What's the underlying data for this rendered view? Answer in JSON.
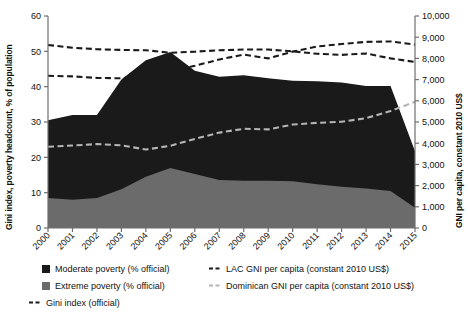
{
  "chart_data": {
    "type": "area",
    "title": "",
    "x": [
      "2000",
      "2001",
      "2002",
      "2003",
      "2004",
      "2005",
      "2006",
      "2007",
      "2008",
      "2009",
      "2010",
      "2011",
      "2012",
      "2013",
      "2014",
      "2015"
    ],
    "xlabel": "",
    "left_axis": {
      "label": "Gini index, poverty headcount, % of population",
      "ylim": [
        0,
        60
      ],
      "ticks": [
        0,
        10,
        20,
        30,
        40,
        50,
        60
      ],
      "tick_labels": [
        "0",
        "10",
        "20",
        "30",
        "40",
        "50",
        "60"
      ]
    },
    "right_axis": {
      "label": "GNI per capita, constant 2010 US$",
      "ylim": [
        0,
        10000
      ],
      "ticks": [
        0,
        1000,
        2000,
        3000,
        4000,
        5000,
        6000,
        7000,
        8000,
        9000,
        10000
      ],
      "tick_labels": [
        "0",
        "1,000",
        "2,000",
        "3,000",
        "4,000",
        "5,000",
        "6,000",
        "7,000",
        "8,000",
        "9,000",
        "10,000"
      ]
    },
    "grid": false,
    "legend_position": "below",
    "series": [
      {
        "name": "Extreme poverty (% official)",
        "type": "area",
        "axis": "left",
        "color": "#6b6b6b",
        "stack_order": 1,
        "values": [
          8.5,
          8.0,
          8.5,
          11.0,
          14.5,
          17.0,
          15.3,
          13.6,
          13.4,
          13.4,
          13.2,
          12.4,
          11.7,
          11.2,
          10.5,
          5.7
        ]
      },
      {
        "name": "Moderate poverty (% official)",
        "type": "area",
        "axis": "left",
        "color": "#1a1a1a",
        "stack_order": 2,
        "values": [
          22.0,
          24.0,
          23.5,
          31.0,
          33.0,
          32.8,
          29.2,
          29.2,
          29.8,
          29.0,
          28.5,
          29.1,
          29.5,
          29.0,
          29.7,
          16.0
        ]
      },
      {
        "name": "Gini index (official)",
        "type": "line",
        "axis": "left",
        "color": "#1a1a1a",
        "dash": "dashed",
        "values": [
          51.8,
          51.0,
          50.6,
          50.4,
          50.3,
          49.6,
          49.9,
          50.3,
          50.5,
          50.5,
          50.0,
          49.3,
          49.0,
          49.4,
          48.0,
          47.0
        ]
      },
      {
        "name": "LAC GNI per capita (constant 2010 US$)",
        "type": "line",
        "axis": "right",
        "color": "#1a1a1a",
        "dash": "dashed",
        "values": [
          7180,
          7150,
          7080,
          7060,
          7220,
          7400,
          7650,
          7950,
          8180,
          8000,
          8320,
          8560,
          8680,
          8780,
          8800,
          8650
        ]
      },
      {
        "name": "Dominican GNI per capita (constant 2010 US$)",
        "type": "line",
        "axis": "right",
        "color": "#b5b5b5",
        "dash": "dashed",
        "values": [
          3830,
          3890,
          3960,
          3900,
          3700,
          3880,
          4200,
          4500,
          4680,
          4650,
          4880,
          4960,
          5010,
          5180,
          5520,
          5950
        ]
      }
    ]
  },
  "legend": {
    "items": [
      {
        "label": "Moderate poverty (% official)",
        "marker": "swatch",
        "color": "#1a1a1a"
      },
      {
        "label": "Extreme poverty (% official)",
        "marker": "swatch",
        "color": "#6b6b6b"
      },
      {
        "label": "Gini index (official)",
        "marker": "dash",
        "color": "#1a1a1a"
      },
      {
        "label": "LAC GNI per capita (constant 2010 US$)",
        "marker": "dash",
        "color": "#1a1a1a"
      },
      {
        "label": "Dominican GNI per capita (constant 2010 US$)",
        "marker": "dash",
        "color": "#b5b5b5"
      }
    ]
  }
}
